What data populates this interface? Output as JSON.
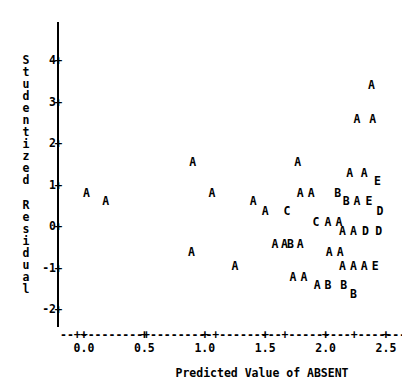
{
  "chart_data": {
    "type": "scatter",
    "title": "",
    "xlabel": "Predicted Value of ABSENT",
    "ylabel": "Studentized Residual",
    "xlim": [
      -0.18,
      2.68
    ],
    "ylim": [
      -2.45,
      4.45
    ],
    "grid": false,
    "legend": "none",
    "xticks": [
      0.0,
      0.5,
      1.0,
      1.5,
      2.0,
      2.5
    ],
    "xtick_labels": [
      "0.0",
      "0.5",
      "1.0",
      "1.5",
      "2.0",
      "2.5"
    ],
    "yticks": [
      4,
      3,
      2,
      1,
      0,
      -1,
      -2
    ],
    "ytick_labels": [
      "4",
      "3",
      "2",
      "1",
      "0",
      "-1",
      "-2"
    ],
    "marker_note": "Letter glyphs encode overplotting count: A=1, B=2, C=3, D=4, E=5",
    "points": [
      {
        "label": "A",
        "x": 2.38,
        "y": 3.4
      },
      {
        "label": "A",
        "x": 2.26,
        "y": 2.58
      },
      {
        "label": "A",
        "x": 2.39,
        "y": 2.58
      },
      {
        "label": "A",
        "x": 0.9,
        "y": 1.55
      },
      {
        "label": "A",
        "x": 1.77,
        "y": 1.55
      },
      {
        "label": "A",
        "x": 2.2,
        "y": 1.28
      },
      {
        "label": "A",
        "x": 2.32,
        "y": 1.28
      },
      {
        "label": "E",
        "x": 2.43,
        "y": 1.1
      },
      {
        "label": "A",
        "x": 0.02,
        "y": 0.8
      },
      {
        "label": "A",
        "x": 1.06,
        "y": 0.8
      },
      {
        "label": "A",
        "x": 1.79,
        "y": 0.8
      },
      {
        "label": "A",
        "x": 1.88,
        "y": 0.8
      },
      {
        "label": "B",
        "x": 2.1,
        "y": 0.8
      },
      {
        "label": "A",
        "x": 0.18,
        "y": 0.62
      },
      {
        "label": "A",
        "x": 1.4,
        "y": 0.62
      },
      {
        "label": "B",
        "x": 2.17,
        "y": 0.62
      },
      {
        "label": "A",
        "x": 2.26,
        "y": 0.62
      },
      {
        "label": "E",
        "x": 2.36,
        "y": 0.62
      },
      {
        "label": "A",
        "x": 1.5,
        "y": 0.38
      },
      {
        "label": "C",
        "x": 1.68,
        "y": 0.38
      },
      {
        "label": "D",
        "x": 2.45,
        "y": 0.38
      },
      {
        "label": "C",
        "x": 1.92,
        "y": 0.12
      },
      {
        "label": "A",
        "x": 2.02,
        "y": 0.12
      },
      {
        "label": "A",
        "x": 2.11,
        "y": 0.12
      },
      {
        "label": "A",
        "x": 2.14,
        "y": -0.12
      },
      {
        "label": "A",
        "x": 2.23,
        "y": -0.12
      },
      {
        "label": "D",
        "x": 2.33,
        "y": -0.12
      },
      {
        "label": "D",
        "x": 2.44,
        "y": -0.12
      },
      {
        "label": "A",
        "x": 1.58,
        "y": -0.42
      },
      {
        "label": "A",
        "x": 1.66,
        "y": -0.42
      },
      {
        "label": "B",
        "x": 1.71,
        "y": -0.42
      },
      {
        "label": "A",
        "x": 1.79,
        "y": -0.42
      },
      {
        "label": "A",
        "x": 0.89,
        "y": -0.62
      },
      {
        "label": "A",
        "x": 2.03,
        "y": -0.62
      },
      {
        "label": "A",
        "x": 2.12,
        "y": -0.62
      },
      {
        "label": "A",
        "x": 1.25,
        "y": -0.95
      },
      {
        "label": "A",
        "x": 2.14,
        "y": -0.95
      },
      {
        "label": "A",
        "x": 2.23,
        "y": -0.95
      },
      {
        "label": "A",
        "x": 2.32,
        "y": -0.95
      },
      {
        "label": "E",
        "x": 2.41,
        "y": -0.95
      },
      {
        "label": "A",
        "x": 1.73,
        "y": -1.22
      },
      {
        "label": "A",
        "x": 1.82,
        "y": -1.22
      },
      {
        "label": "A",
        "x": 1.93,
        "y": -1.42
      },
      {
        "label": "B",
        "x": 2.02,
        "y": -1.42
      },
      {
        "label": "B",
        "x": 2.15,
        "y": -1.42
      },
      {
        "label": "B",
        "x": 2.23,
        "y": -1.62
      }
    ]
  },
  "axes": {
    "y_title_chars": [
      "S",
      "t",
      "u",
      "d",
      "e",
      "n",
      "t",
      "i",
      "z",
      "e",
      "d",
      "",
      "R",
      "e",
      "s",
      "i",
      "d",
      "u",
      "a",
      "l"
    ],
    "x_title": "Predicted Value of ABSENT",
    "x_axis_dashes": "--+---------+---------+---------+---------+---------+--",
    "tick_glyph": "+"
  }
}
